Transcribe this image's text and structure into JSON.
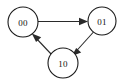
{
  "diagram": {
    "type": "directed-state-graph",
    "background_color": "#ffffff",
    "node_fill_color": "#ffffff",
    "node_stroke_color": "#1b1b1b",
    "edge_color": "#2a2a2a",
    "label_color": "#111111",
    "nodes": [
      {
        "id": "n00",
        "label": "00",
        "cx": 23,
        "cy": 22,
        "r": 15
      },
      {
        "id": "n01",
        "label": "01",
        "cx": 102,
        "cy": 21,
        "r": 14
      },
      {
        "id": "n10",
        "label": "10",
        "cx": 63,
        "cy": 63,
        "r": 15
      }
    ],
    "edges": [
      {
        "id": "e1",
        "from": "00",
        "to": "01",
        "directed": true,
        "arrow_at": "01"
      },
      {
        "id": "e2",
        "from": "01",
        "to": "10",
        "directed": true,
        "arrow_at": "10"
      },
      {
        "id": "e3",
        "from": "10",
        "to": "00",
        "directed": true,
        "arrow_at": "00"
      }
    ],
    "cycle_description": "00 -> 01 -> 10 -> 00"
  }
}
